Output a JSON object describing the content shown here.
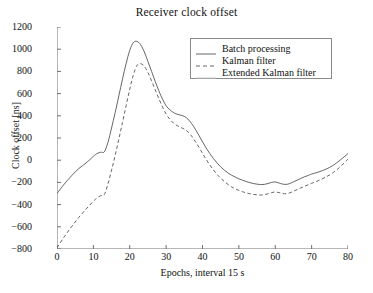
{
  "chart_data": {
    "type": "line",
    "title": "Receiver clock offset",
    "xlabel": "Epochs, interval 15 s",
    "ylabel": "Clock offset [ns]",
    "xlim": [
      0,
      80
    ],
    "ylim": [
      -800,
      1200
    ],
    "xticks": [
      0,
      10,
      20,
      30,
      40,
      50,
      60,
      70,
      80
    ],
    "yticks": [
      -800,
      -600,
      -400,
      -200,
      0,
      200,
      400,
      600,
      800,
      1000,
      1200
    ],
    "grid": false,
    "legend_position": "upper right",
    "series": [
      {
        "name": "Batch processing",
        "style": "solid",
        "color": "#555555",
        "x": [
          0,
          2,
          4,
          6,
          8,
          10,
          11,
          12,
          13,
          14,
          15,
          16,
          17,
          18,
          19,
          20,
          21,
          22,
          23,
          24,
          25,
          26,
          27,
          28,
          29,
          30,
          31,
          32,
          33,
          34,
          35,
          36,
          37,
          38,
          39,
          40,
          41,
          42,
          43,
          44,
          45,
          46,
          47,
          48,
          49,
          50,
          51,
          52,
          53,
          54,
          55,
          56,
          57,
          58,
          59,
          60,
          61,
          62,
          63,
          64,
          65,
          66,
          67,
          68,
          69,
          70,
          72,
          74,
          76,
          78,
          80
        ],
        "y": [
          -300,
          -215,
          -140,
          -75,
          -25,
          35,
          60,
          72,
          75,
          160,
          290,
          430,
          580,
          730,
          870,
          990,
          1060,
          1070,
          1040,
          975,
          890,
          800,
          710,
          625,
          550,
          490,
          455,
          430,
          415,
          405,
          395,
          370,
          330,
          280,
          225,
          165,
          110,
          60,
          15,
          -25,
          -60,
          -90,
          -115,
          -135,
          -152,
          -168,
          -180,
          -192,
          -202,
          -210,
          -216,
          -220,
          -218,
          -210,
          -200,
          -196,
          -205,
          -215,
          -218,
          -210,
          -195,
          -180,
          -165,
          -150,
          -138,
          -125,
          -105,
          -80,
          -45,
          5,
          60
        ]
      },
      {
        "name": "Kalman filter",
        "style": "dashed",
        "color": "#555555",
        "x": [
          0,
          2,
          4,
          6,
          8,
          10,
          11,
          12,
          13,
          14,
          15,
          16,
          17,
          18,
          19,
          20,
          21,
          22,
          23,
          24,
          25,
          26,
          27,
          28,
          29,
          30,
          31,
          32,
          33,
          34,
          35,
          36,
          37,
          38,
          39,
          40,
          41,
          42,
          43,
          44,
          45,
          46,
          47,
          48,
          49,
          50,
          51,
          52,
          53,
          54,
          55,
          56,
          57,
          58,
          59,
          60,
          61,
          62,
          63,
          64,
          65,
          66,
          67,
          68,
          69,
          70,
          72,
          74,
          76,
          78,
          80
        ],
        "y": [
          -790,
          -690,
          -600,
          -515,
          -440,
          -370,
          -340,
          -320,
          -310,
          -215,
          -90,
          45,
          190,
          340,
          490,
          640,
          770,
          855,
          870,
          845,
          790,
          715,
          635,
          555,
          480,
          415,
          370,
          335,
          312,
          295,
          280,
          255,
          218,
          170,
          118,
          62,
          8,
          -42,
          -88,
          -128,
          -162,
          -192,
          -218,
          -240,
          -258,
          -272,
          -284,
          -294,
          -302,
          -308,
          -312,
          -314,
          -310,
          -302,
          -292,
          -286,
          -292,
          -300,
          -302,
          -294,
          -280,
          -265,
          -250,
          -236,
          -222,
          -208,
          -182,
          -150,
          -110,
          -55,
          10
        ]
      },
      {
        "name": "Extended Kalman filter",
        "style": "solid",
        "color": "#c9c9c9",
        "x": [],
        "y": []
      }
    ]
  },
  "legend": {
    "entries": [
      {
        "label": "Batch processing"
      },
      {
        "label": "Kalman filter"
      },
      {
        "label": "Extended Kalman filter"
      }
    ]
  },
  "axes": {
    "ytick_labels": [
      "1200",
      "1000",
      "800",
      "600",
      "400",
      "200",
      "0",
      "−200",
      "−400",
      "−600",
      "−800"
    ],
    "xtick_labels": [
      "0",
      "10",
      "20",
      "30",
      "40",
      "50",
      "60",
      "70",
      "80"
    ]
  },
  "colors": {
    "axis": "#6f6f6f",
    "batch": "#555555",
    "kalman": "#555555",
    "extended": "#c9c9c9",
    "text": "#111111"
  }
}
